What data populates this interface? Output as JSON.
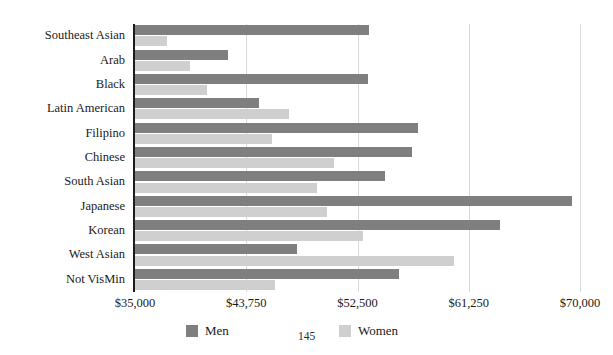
{
  "page": {
    "number": "145"
  },
  "chart_data": {
    "type": "bar",
    "orientation": "horizontal",
    "title": "",
    "xlabel": "",
    "ylabel": "",
    "grid": true,
    "xlim": [
      35000,
      70000
    ],
    "xticks": [
      35000,
      43750,
      52500,
      61250,
      70000
    ],
    "xtick_labels": [
      "$35,000",
      "$43,750",
      "$52,500",
      "$61,250",
      "$70,000"
    ],
    "legend_position": "bottom",
    "categories": [
      "Southeast Asian",
      "Arab",
      "Black",
      "Latin American",
      "Filipino",
      "Chinese",
      "South Asian",
      "Japanese",
      "Korean",
      "West Asian",
      "Not VisMin"
    ],
    "series": [
      {
        "name": "Men",
        "color": "#7f7f7f",
        "values": [
          53400,
          42300,
          53300,
          44750,
          57250,
          56750,
          54650,
          69350,
          63700,
          47750,
          55750
        ]
      },
      {
        "name": "Women",
        "color": "#cfcfcf",
        "values": [
          37500,
          39300,
          40700,
          47100,
          45800,
          50650,
          49300,
          50100,
          52950,
          60100,
          46000
        ]
      }
    ]
  }
}
